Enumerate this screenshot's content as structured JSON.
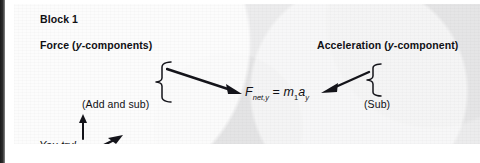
{
  "figure": {
    "block_title": "Block 1",
    "left_heading": "Force (y-components)",
    "right_heading": "Acceleration (y-component)",
    "left_operation": "(Add and sub)",
    "right_operation": "(Sub)",
    "equation": {
      "lhs_symbol": "F",
      "lhs_subscript": "net,y",
      "equals": "=",
      "rhs_mass": "m",
      "rhs_mass_subscript": "1",
      "rhs_accel": "a",
      "rhs_accel_subscript": "y",
      "plain_text": "F_net,y = m_1 a_y"
    },
    "prompt": "You try!",
    "icons": {
      "left_brace": "right-facing-curly-brace",
      "right_brace": "left-facing-curly-brace",
      "left_arrow": "arrow-down-right",
      "right_arrow": "arrow-down-left",
      "up_arrow": "arrow-up",
      "pointer_arrow": "arrow-up-right"
    },
    "colors": {
      "ink": "#101014",
      "page": "#ececed",
      "spine": "#1a1a1a"
    }
  }
}
